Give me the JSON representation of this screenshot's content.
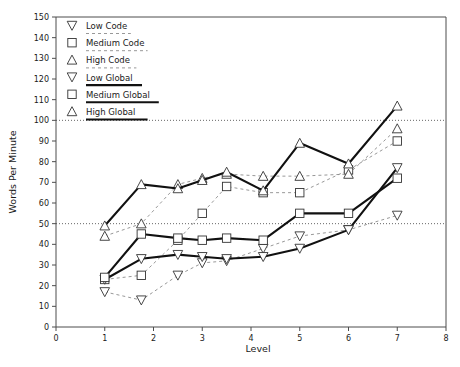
{
  "chart_data": {
    "type": "line",
    "title": "",
    "xlabel": "Level",
    "ylabel": "Words Per Minute",
    "xlim": [
      0,
      8
    ],
    "ylim": [
      0,
      150
    ],
    "xticks": [
      0,
      1,
      2,
      3,
      4,
      5,
      6,
      7,
      8
    ],
    "yticks": [
      0,
      10,
      20,
      30,
      40,
      50,
      60,
      70,
      80,
      90,
      100,
      110,
      120,
      130,
      140,
      150
    ],
    "grid": false,
    "reference_lines": [
      50,
      100
    ],
    "legend_position": "top-left",
    "x": [
      1,
      1.75,
      2.5,
      3,
      3.5,
      4.25,
      5,
      6,
      7
    ],
    "series": [
      {
        "name": "Low Code",
        "marker": "triangle-down",
        "style": "dotted",
        "values": [
          17,
          13,
          25,
          31,
          32,
          38,
          44,
          47,
          54
        ]
      },
      {
        "name": "Medium Code",
        "marker": "square",
        "style": "dotted",
        "values": [
          23,
          25,
          42,
          55,
          68,
          65,
          65,
          76,
          90
        ]
      },
      {
        "name": "High Code",
        "marker": "triangle-up",
        "style": "dotted",
        "values": [
          44,
          50,
          69,
          72,
          74,
          73,
          73,
          74,
          96
        ]
      },
      {
        "name": "Low Global",
        "marker": "triangle-down",
        "style": "solid",
        "values": [
          23,
          33,
          35,
          34,
          33,
          34,
          38,
          47,
          77
        ]
      },
      {
        "name": "Medium Global",
        "marker": "square",
        "style": "solid",
        "values": [
          24,
          45,
          43,
          42,
          43,
          42,
          55,
          55,
          72
        ]
      },
      {
        "name": "High Global",
        "marker": "triangle-up",
        "style": "solid",
        "values": [
          49,
          69,
          67,
          71,
          75,
          66,
          89,
          79,
          107
        ]
      }
    ]
  },
  "legend": {
    "items": [
      {
        "label": "Low Code",
        "marker": "triangle-down-icon",
        "style": "dotted"
      },
      {
        "label": "Medium Code",
        "marker": "square-icon",
        "style": "dotted"
      },
      {
        "label": "High Code",
        "marker": "triangle-up-icon",
        "style": "dotted"
      },
      {
        "label": "Low Global",
        "marker": "triangle-down-icon",
        "style": "solid"
      },
      {
        "label": "Medium Global",
        "marker": "square-icon",
        "style": "solid"
      },
      {
        "label": "High Global",
        "marker": "triangle-up-icon",
        "style": "solid"
      }
    ]
  },
  "colors": {
    "background": "#ffffff",
    "axis": "#4d4d4d",
    "solid_line": "#111111",
    "dotted_line": "#8c8c8c",
    "marker_stroke": "#333333",
    "reference_line": "#555555"
  }
}
